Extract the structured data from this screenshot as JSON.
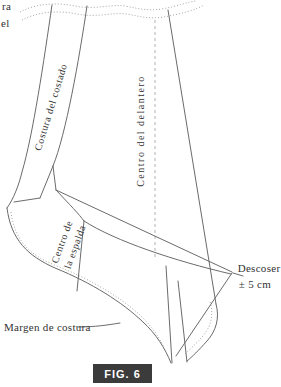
{
  "caption": "FIG. 6",
  "colors": {
    "background": "#ffffff",
    "solid_line": "#6b6b6b",
    "dotted_line": "#9b9b9b",
    "dashed_line": "#a9a9a9",
    "text": "#333333",
    "badge_background": "#3b3b3b",
    "badge_text": "#ffffff"
  },
  "labels": {
    "cropped_fragment_line1": "ra",
    "cropped_fragment_line2": "el",
    "side_seam": "Costura del costado",
    "center_front": "Centro del delantero",
    "center_back_line1": "Centro de",
    "center_back_line2": "la espalda",
    "unpick_line1": "Descoser",
    "unpick_line2": "± 5 cm",
    "seam_allowance": "Margen de costura"
  }
}
